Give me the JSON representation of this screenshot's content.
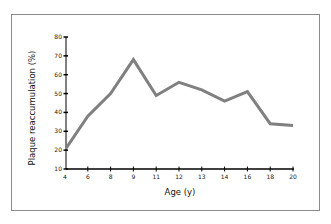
{
  "chart_data": {
    "type": "line",
    "title": "",
    "xlabel": "Age (y)",
    "ylabel": "Plaque reaccumulation (%)",
    "categories": [
      "4",
      "6",
      "8",
      "9",
      "11",
      "12",
      "13",
      "14",
      "16",
      "18",
      "20"
    ],
    "series": [
      {
        "name": "Plaque reaccumulation",
        "values": [
          21,
          38,
          50,
          68,
          49,
          56,
          52,
          46,
          51,
          34,
          33
        ]
      }
    ],
    "yticks": [
      10,
      20,
      30,
      40,
      50,
      60,
      70,
      80
    ],
    "ylim": [
      10,
      80
    ],
    "grid": false,
    "legend": "none",
    "line_color": "#808080"
  }
}
